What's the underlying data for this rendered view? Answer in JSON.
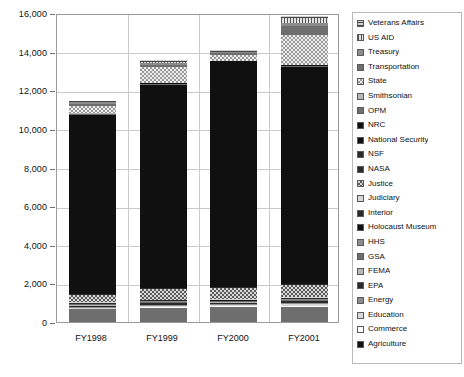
{
  "chart_data": {
    "type": "bar",
    "subtype": "stacked",
    "title": "",
    "xlabel": "",
    "ylabel": "",
    "categories": [
      "FY1998",
      "FY1999",
      "FY2000",
      "FY2001"
    ],
    "ylim": [
      0,
      16000
    ],
    "yticks": [
      0,
      2000,
      4000,
      6000,
      8000,
      10000,
      12000,
      14000,
      16000
    ],
    "ytick_labels": [
      "0",
      "2,000",
      "4,000",
      "6,000",
      "8,000",
      "10,000",
      "12,000",
      "14,000",
      "16,000"
    ],
    "grid": true,
    "legend_position": "right",
    "totals": [
      11450,
      13550,
      14000,
      15850
    ],
    "series": [
      {
        "name": "Agriculture",
        "pattern": "p-solid-mid",
        "values": [
          660,
          740,
          770,
          800
        ]
      },
      {
        "name": "Commerce",
        "pattern": "p-solid-white",
        "values": [
          35,
          45,
          45,
          55
        ]
      },
      {
        "name": "Education",
        "pattern": "p-solid-vlite",
        "values": [
          40,
          50,
          55,
          60
        ]
      },
      {
        "name": "Energy",
        "pattern": "p-solid-midlite",
        "values": [
          60,
          70,
          75,
          80
        ]
      },
      {
        "name": "EPA",
        "pattern": "p-solid-dark",
        "values": [
          55,
          60,
          60,
          70
        ]
      },
      {
        "name": "FEMA",
        "pattern": "p-solid-lite",
        "values": [
          30,
          35,
          35,
          40
        ]
      },
      {
        "name": "GSA",
        "pattern": "p-solid-mid",
        "values": [
          30,
          35,
          35,
          40
        ]
      },
      {
        "name": "HHS",
        "pattern": "p-solid-midlite",
        "values": [
          35,
          40,
          40,
          45
        ]
      },
      {
        "name": "Holocaust Museum",
        "pattern": "p-solid-black",
        "values": [
          15,
          15,
          15,
          20
        ]
      },
      {
        "name": "Interior",
        "pattern": "p-solid-dark",
        "values": [
          30,
          35,
          35,
          40
        ]
      },
      {
        "name": "Judiciary",
        "pattern": "p-solid-vlite",
        "values": [
          25,
          30,
          30,
          35
        ]
      },
      {
        "name": "Justice",
        "pattern": "p-check",
        "values": [
          390,
          560,
          560,
          620
        ]
      },
      {
        "name": "NASA",
        "pattern": "p-solid-dark",
        "values": [
          35,
          40,
          40,
          45
        ]
      },
      {
        "name": "NSF",
        "pattern": "p-solid-dark",
        "values": [
          25,
          30,
          30,
          35
        ]
      },
      {
        "name": "National Security",
        "pattern": "p-solid-black",
        "values": [
          9280,
          10510,
          11620,
          11240
        ]
      },
      {
        "name": "OPM",
        "pattern": "p-solid-mid",
        "values": [
          35,
          40,
          40,
          45
        ]
      },
      {
        "name": "NRC",
        "pattern": "p-solid-black",
        "values": [
          20,
          25,
          25,
          30
        ]
      },
      {
        "name": "Smithsonian",
        "pattern": "p-solid-lite",
        "values": [
          25,
          30,
          30,
          35
        ]
      },
      {
        "name": "State",
        "pattern": "p-check-lite",
        "values": [
          360,
          830,
          290,
          1510
        ]
      },
      {
        "name": "Transportation",
        "pattern": "p-solid-mid",
        "values": [
          110,
          120,
          100,
          490
        ]
      },
      {
        "name": "Treasury",
        "pattern": "p-solid-midlite",
        "values": [
          80,
          90,
          40,
          180
        ]
      },
      {
        "name": "US AID",
        "pattern": "p-vline",
        "values": [
          35,
          45,
          40,
          220
        ]
      },
      {
        "name": "Veterans Affairs",
        "pattern": "p-hline",
        "values": [
          45,
          75,
          60,
          115
        ]
      }
    ]
  },
  "legend": {
    "items": [
      {
        "label": "Veterans Affairs",
        "pattern": "p-hline"
      },
      {
        "label": "US AID",
        "pattern": "p-vline"
      },
      {
        "label": "Treasury",
        "pattern": "p-solid-midlite"
      },
      {
        "label": "Transportation",
        "pattern": "p-solid-mid"
      },
      {
        "label": "State",
        "pattern": "p-check-lite"
      },
      {
        "label": "Smithsonian",
        "pattern": "p-solid-lite"
      },
      {
        "label": "OPM",
        "pattern": "p-solid-mid"
      },
      {
        "label": "NRC",
        "pattern": "p-solid-black"
      },
      {
        "label": "National Security",
        "pattern": "p-solid-black"
      },
      {
        "label": "NSF",
        "pattern": "p-solid-dark"
      },
      {
        "label": "NASA",
        "pattern": "p-solid-dark"
      },
      {
        "label": "Justice",
        "pattern": "p-check"
      },
      {
        "label": "Judiciary",
        "pattern": "p-solid-vlite"
      },
      {
        "label": "Interior",
        "pattern": "p-solid-dark"
      },
      {
        "label": "Holocaust Museum",
        "pattern": "p-solid-black"
      },
      {
        "label": "HHS",
        "pattern": "p-solid-midlite"
      },
      {
        "label": "GSA",
        "pattern": "p-solid-mid"
      },
      {
        "label": "FEMA",
        "pattern": "p-solid-lite"
      },
      {
        "label": "EPA",
        "pattern": "p-solid-dark"
      },
      {
        "label": "Energy",
        "pattern": "p-solid-midlite"
      },
      {
        "label": "Education",
        "pattern": "p-solid-vlite"
      },
      {
        "label": "Commerce",
        "pattern": "p-solid-white"
      },
      {
        "label": "Agriculture",
        "pattern": "p-solid-black"
      }
    ]
  },
  "colors": {
    "grid": "#c9c9c9",
    "frame": "#9a9a9a",
    "text": "#111111",
    "background": "#ffffff"
  }
}
